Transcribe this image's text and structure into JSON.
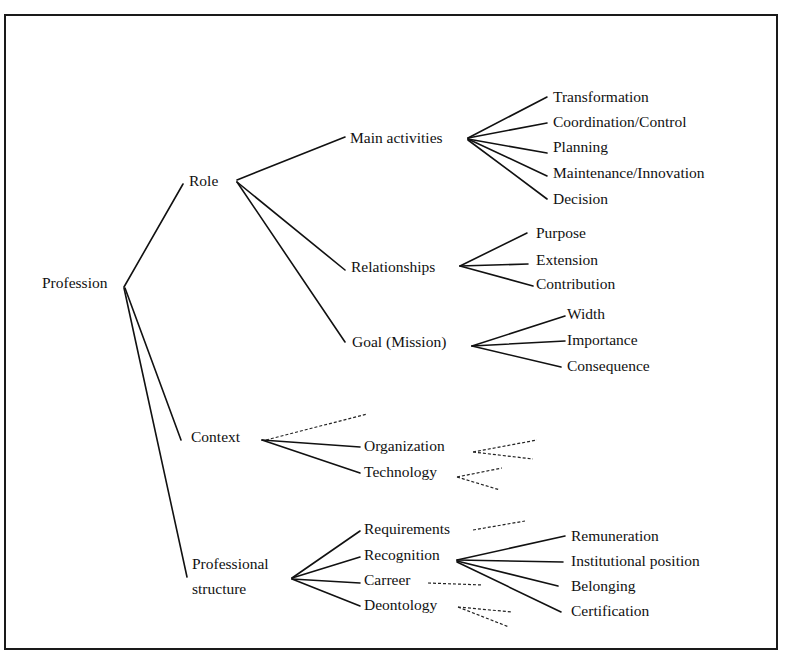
{
  "diagram": {
    "type": "tree",
    "root": "Profession",
    "nodes": {
      "profession": "Profession",
      "role": "Role",
      "main_activities": "Main activities",
      "transformation": "Transformation",
      "coordination_control": "Coordination/Control",
      "planning": "Planning",
      "maintenance_innovation": "Maintenance/Innovation",
      "decision": "Decision",
      "relationships": "Relationships",
      "purpose": "Purpose",
      "extension": "Extension",
      "contribution": "Contribution",
      "goal_mission": "Goal  (Mission)",
      "width": "Width",
      "importance": "Importance",
      "consequence": "Consequence",
      "context": "Context",
      "organization": "Organization",
      "technology": "Technology",
      "professional_structure_line1": "Professional",
      "professional_structure_line2": "structure",
      "requirements": "Requirements",
      "recognition": "Recognition",
      "carreer": "Carreer",
      "deontology": "Deontology",
      "remuneration": "Remuneration",
      "institutional_position": "Institutional position",
      "belonging": "Belonging",
      "certification": "Certification"
    },
    "edges_solid": [
      [
        "Profession",
        "Role"
      ],
      [
        "Profession",
        "Context"
      ],
      [
        "Profession",
        "Professional structure"
      ],
      [
        "Role",
        "Main activities"
      ],
      [
        "Role",
        "Relationships"
      ],
      [
        "Role",
        "Goal (Mission)"
      ],
      [
        "Main activities",
        "Transformation"
      ],
      [
        "Main activities",
        "Coordination/Control"
      ],
      [
        "Main activities",
        "Planning"
      ],
      [
        "Main activities",
        "Maintenance/Innovation"
      ],
      [
        "Main activities",
        "Decision"
      ],
      [
        "Relationships",
        "Purpose"
      ],
      [
        "Relationships",
        "Extension"
      ],
      [
        "Relationships",
        "Contribution"
      ],
      [
        "Goal (Mission)",
        "Width"
      ],
      [
        "Goal (Mission)",
        "Importance"
      ],
      [
        "Goal (Mission)",
        "Consequence"
      ],
      [
        "Context",
        "Organization"
      ],
      [
        "Context",
        "Technology"
      ],
      [
        "Professional structure",
        "Requirements"
      ],
      [
        "Professional structure",
        "Recognition"
      ],
      [
        "Professional structure",
        "Carreer"
      ],
      [
        "Professional structure",
        "Deontology"
      ],
      [
        "Recognition",
        "Remuneration"
      ],
      [
        "Recognition",
        "Institutional position"
      ],
      [
        "Recognition",
        "Belonging"
      ],
      [
        "Recognition",
        "Certification"
      ]
    ],
    "edges_dashed_unexpanded": [
      "Context",
      "Organization",
      "Technology",
      "Requirements",
      "Carreer",
      "Deontology"
    ],
    "colors": {
      "ink": "#111111",
      "frame": "#1a1a1a",
      "background": "#ffffff"
    }
  }
}
